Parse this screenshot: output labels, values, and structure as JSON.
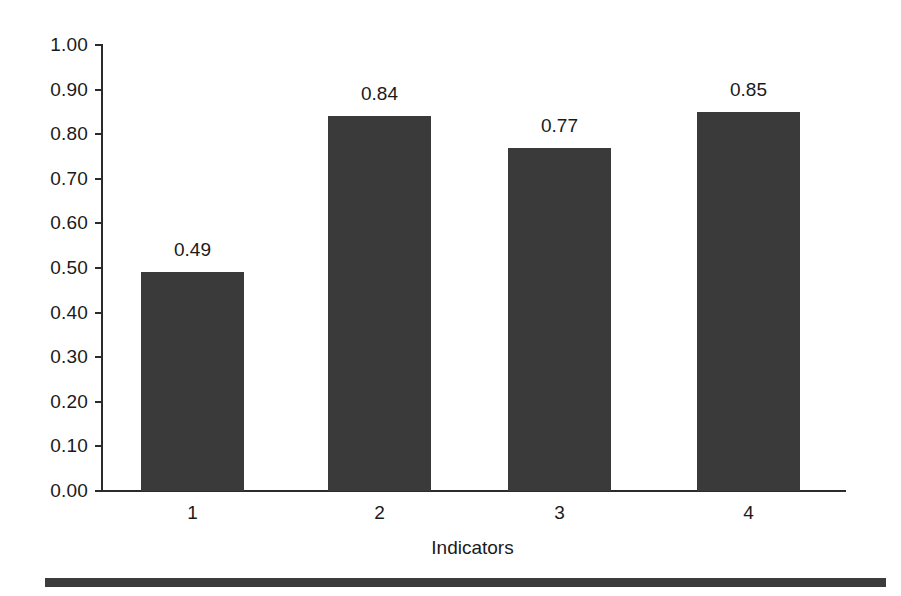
{
  "chart_data": {
    "type": "bar",
    "title": "",
    "subtitle": "",
    "xlabel": "Indicators",
    "ylabel": "",
    "categories": [
      "1",
      "2",
      "3",
      "4"
    ],
    "values": [
      0.49,
      0.84,
      0.77,
      0.85
    ],
    "value_labels": [
      "0.49",
      "0.84",
      "0.77",
      "0.85"
    ],
    "ylim": [
      0.0,
      1.0
    ],
    "ytick_labels": [
      "1.00",
      "0.90",
      "0.80",
      "0.70",
      "0.60",
      "0.50",
      "0.40",
      "0.30",
      "0.20",
      "0.10",
      "0.00"
    ],
    "ytick_values": [
      1.0,
      0.9,
      0.8,
      0.7,
      0.6,
      0.5,
      0.4,
      0.3,
      0.2,
      0.1,
      0.0
    ],
    "grid": false,
    "legend": null,
    "legend_position": "none",
    "bar_color": "#3a3a3a",
    "axis_color": "#2b2b2b",
    "text_color": "#1a1a1a",
    "background_color": "#ffffff"
  },
  "footer": {
    "rule_color": "#3c3c3c"
  }
}
